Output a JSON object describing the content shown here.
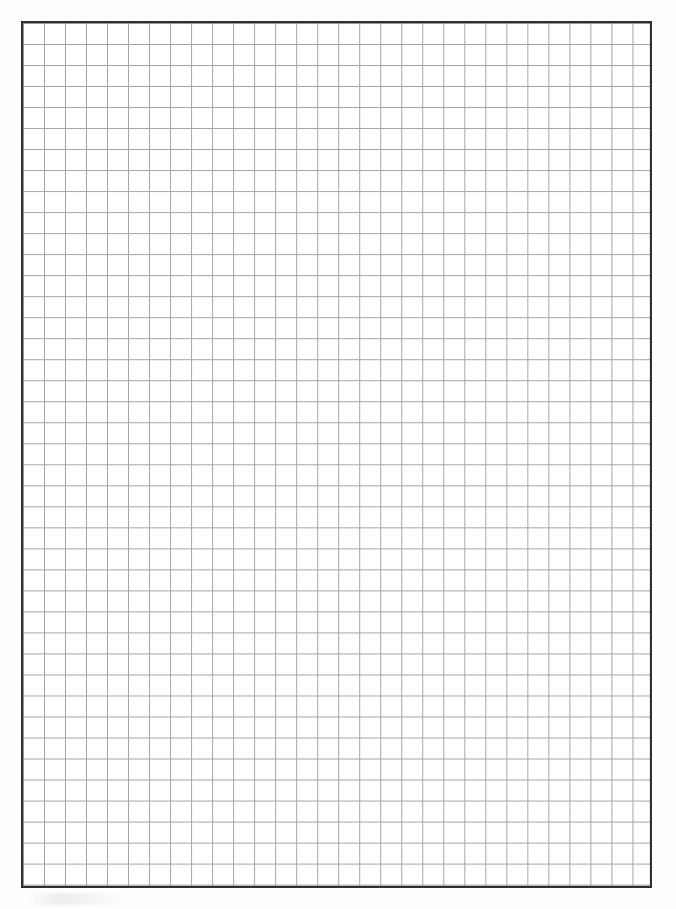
{
  "document": {
    "kind": "graph-paper-scan",
    "title": "Blank Square Grid Paper",
    "page_width": 676,
    "page_height": 909,
    "background_color": "#ffffff",
    "paper_color": "#fefefe",
    "text_content": "",
    "annotations": []
  },
  "grid": {
    "label": "square-grid-field",
    "left": 21,
    "top": 21,
    "width": 631,
    "height": 867,
    "columns": 30,
    "rows": 41,
    "cell_size": 21.03,
    "line_color": "#a2a2a2",
    "line_width": 1,
    "border_color": "#2f2f2f",
    "border_width": 2,
    "subdivisions": 0,
    "fill_color": "#ffffff"
  },
  "chart_data": {
    "type": "table",
    "xlabel": "",
    "ylabel": "",
    "categories": [],
    "values": [],
    "grid": true,
    "legend": "none"
  }
}
